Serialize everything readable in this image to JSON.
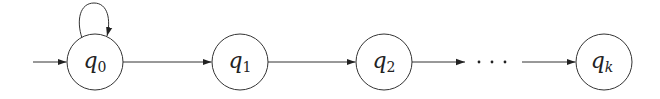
{
  "diagram": {
    "type": "finite-automaton",
    "stroke_color": "#333333",
    "states": [
      {
        "id": "q0",
        "base": "q",
        "sub": "0",
        "sub_italic": false,
        "cx": 95,
        "cy": 62,
        "r": 28,
        "initial": true,
        "self_loop": true
      },
      {
        "id": "q1",
        "base": "q",
        "sub": "1",
        "sub_italic": false,
        "cx": 240,
        "cy": 62,
        "r": 28
      },
      {
        "id": "q2",
        "base": "q",
        "sub": "2",
        "sub_italic": false,
        "cx": 384,
        "cy": 62,
        "r": 28
      },
      {
        "id": "qk",
        "base": "q",
        "sub": "k",
        "sub_italic": true,
        "cx": 604,
        "cy": 62,
        "r": 28
      }
    ],
    "transitions": [
      {
        "from": "start",
        "to": "q0"
      },
      {
        "from": "q0",
        "to": "q0",
        "kind": "self-loop"
      },
      {
        "from": "q0",
        "to": "q1"
      },
      {
        "from": "q1",
        "to": "q2"
      },
      {
        "from": "q2",
        "to": "..."
      },
      {
        "from": "...",
        "to": "qk"
      }
    ],
    "ellipsis": "· · ·"
  }
}
